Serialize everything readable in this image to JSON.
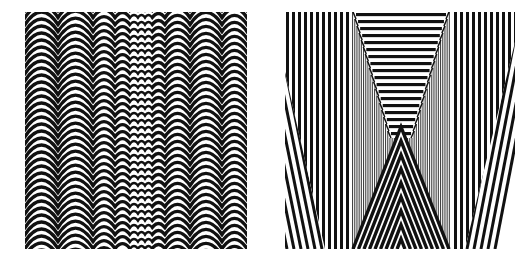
{
  "colors": {
    "background": "#ffffff",
    "ink": "#111111",
    "grey": "#8a8a8a"
  },
  "left_artwork": {
    "x": 25,
    "y": 12,
    "width": 222,
    "height": 237,
    "arc_period": 7,
    "arc_stroke": 3.4,
    "arc_depth": 14,
    "columns": [
      33,
      35,
      22,
      15,
      8,
      7,
      7,
      13,
      25,
      32,
      25
    ]
  },
  "right_artwork": {
    "x": 285,
    "y": 12,
    "width": 230,
    "height": 237,
    "stripe_period": 6,
    "stripe_width": 3,
    "center_left": 67,
    "center_right": 165,
    "trapezoid": {
      "top_y": 0,
      "bottom_y": 130,
      "top_inset": 4,
      "bottom_half_width": 8,
      "band": 7
    },
    "chevron": {
      "apex_y": 115,
      "base_half_width": 48,
      "band": 7
    },
    "edge_wedge": {
      "top_y": 60,
      "width_bottom": 40,
      "period": 7
    }
  }
}
